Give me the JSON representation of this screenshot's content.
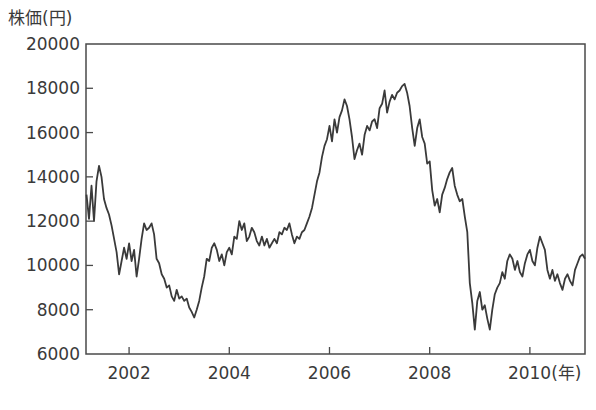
{
  "chart_data": {
    "type": "line",
    "title": "",
    "xlabel": "(年)",
    "ylabel": "株価(円)",
    "xlim": [
      2001.14,
      2011.1
    ],
    "ylim": [
      6000,
      20000
    ],
    "x_ticks": [
      2002,
      2004,
      2006,
      2008,
      2010
    ],
    "x_tick_labels": [
      "2002",
      "2004",
      "2006",
      "2008",
      "2010(年)"
    ],
    "y_ticks": [
      6000,
      8000,
      10000,
      12000,
      14000,
      16000,
      18000,
      20000
    ],
    "y_tick_labels": [
      "6000",
      "8000",
      "10000",
      "12000",
      "14000",
      "16000",
      "18000",
      "20000"
    ],
    "grid": false,
    "legend": null,
    "line_color": "#3a3a3a",
    "series": [
      {
        "name": "株価",
        "points": [
          [
            2001.15,
            13200
          ],
          [
            2001.2,
            12100
          ],
          [
            2001.25,
            13600
          ],
          [
            2001.3,
            12000
          ],
          [
            2001.35,
            13800
          ],
          [
            2001.4,
            14500
          ],
          [
            2001.45,
            14000
          ],
          [
            2001.5,
            13000
          ],
          [
            2001.55,
            12600
          ],
          [
            2001.6,
            12300
          ],
          [
            2001.65,
            11800
          ],
          [
            2001.7,
            11200
          ],
          [
            2001.75,
            10600
          ],
          [
            2001.8,
            9600
          ],
          [
            2001.85,
            10200
          ],
          [
            2001.9,
            10800
          ],
          [
            2001.95,
            10300
          ],
          [
            2002.0,
            11000
          ],
          [
            2002.05,
            10200
          ],
          [
            2002.1,
            10700
          ],
          [
            2002.15,
            9500
          ],
          [
            2002.2,
            10300
          ],
          [
            2002.25,
            11200
          ],
          [
            2002.3,
            11900
          ],
          [
            2002.35,
            11600
          ],
          [
            2002.4,
            11700
          ],
          [
            2002.45,
            11900
          ],
          [
            2002.5,
            11400
          ],
          [
            2002.55,
            10300
          ],
          [
            2002.6,
            10100
          ],
          [
            2002.65,
            9600
          ],
          [
            2002.7,
            9400
          ],
          [
            2002.75,
            9000
          ],
          [
            2002.8,
            9100
          ],
          [
            2002.85,
            8600
          ],
          [
            2002.9,
            8400
          ],
          [
            2002.95,
            8900
          ],
          [
            2003.0,
            8500
          ],
          [
            2003.05,
            8600
          ],
          [
            2003.1,
            8400
          ],
          [
            2003.15,
            8500
          ],
          [
            2003.2,
            8100
          ],
          [
            2003.25,
            7900
          ],
          [
            2003.3,
            7650
          ],
          [
            2003.35,
            8000
          ],
          [
            2003.4,
            8400
          ],
          [
            2003.45,
            9000
          ],
          [
            2003.5,
            9500
          ],
          [
            2003.55,
            10300
          ],
          [
            2003.6,
            10200
          ],
          [
            2003.65,
            10800
          ],
          [
            2003.7,
            11000
          ],
          [
            2003.75,
            10700
          ],
          [
            2003.8,
            10200
          ],
          [
            2003.85,
            10500
          ],
          [
            2003.9,
            10000
          ],
          [
            2003.95,
            10600
          ],
          [
            2004.0,
            10800
          ],
          [
            2004.05,
            10500
          ],
          [
            2004.1,
            11300
          ],
          [
            2004.15,
            11200
          ],
          [
            2004.2,
            12000
          ],
          [
            2004.25,
            11600
          ],
          [
            2004.3,
            11900
          ],
          [
            2004.35,
            11100
          ],
          [
            2004.4,
            11300
          ],
          [
            2004.45,
            11700
          ],
          [
            2004.5,
            11500
          ],
          [
            2004.55,
            11100
          ],
          [
            2004.6,
            10900
          ],
          [
            2004.65,
            11300
          ],
          [
            2004.7,
            10900
          ],
          [
            2004.75,
            11200
          ],
          [
            2004.8,
            10800
          ],
          [
            2004.85,
            11000
          ],
          [
            2004.9,
            11200
          ],
          [
            2004.95,
            11000
          ],
          [
            2005.0,
            11500
          ],
          [
            2005.05,
            11400
          ],
          [
            2005.1,
            11700
          ],
          [
            2005.15,
            11600
          ],
          [
            2005.2,
            11900
          ],
          [
            2005.25,
            11400
          ],
          [
            2005.3,
            11000
          ],
          [
            2005.35,
            11300
          ],
          [
            2005.4,
            11200
          ],
          [
            2005.45,
            11500
          ],
          [
            2005.5,
            11600
          ],
          [
            2005.55,
            11900
          ],
          [
            2005.6,
            12200
          ],
          [
            2005.65,
            12600
          ],
          [
            2005.7,
            13200
          ],
          [
            2005.75,
            13800
          ],
          [
            2005.8,
            14200
          ],
          [
            2005.85,
            14900
          ],
          [
            2005.9,
            15400
          ],
          [
            2005.95,
            15700
          ],
          [
            2006.0,
            16300
          ],
          [
            2006.05,
            15600
          ],
          [
            2006.1,
            16600
          ],
          [
            2006.15,
            16000
          ],
          [
            2006.2,
            16700
          ],
          [
            2006.25,
            17000
          ],
          [
            2006.3,
            17500
          ],
          [
            2006.35,
            17200
          ],
          [
            2006.4,
            16600
          ],
          [
            2006.45,
            15800
          ],
          [
            2006.5,
            14800
          ],
          [
            2006.55,
            15200
          ],
          [
            2006.6,
            15500
          ],
          [
            2006.65,
            15000
          ],
          [
            2006.7,
            15900
          ],
          [
            2006.75,
            16300
          ],
          [
            2006.8,
            16100
          ],
          [
            2006.85,
            16500
          ],
          [
            2006.9,
            16600
          ],
          [
            2006.95,
            16200
          ],
          [
            2007.0,
            17100
          ],
          [
            2007.05,
            17300
          ],
          [
            2007.1,
            17900
          ],
          [
            2007.15,
            16900
          ],
          [
            2007.2,
            17400
          ],
          [
            2007.25,
            17700
          ],
          [
            2007.3,
            17500
          ],
          [
            2007.35,
            17800
          ],
          [
            2007.4,
            17900
          ],
          [
            2007.45,
            18100
          ],
          [
            2007.5,
            18200
          ],
          [
            2007.55,
            17800
          ],
          [
            2007.6,
            17200
          ],
          [
            2007.65,
            16200
          ],
          [
            2007.7,
            15400
          ],
          [
            2007.75,
            16200
          ],
          [
            2007.8,
            16600
          ],
          [
            2007.85,
            15800
          ],
          [
            2007.9,
            15500
          ],
          [
            2007.95,
            14600
          ],
          [
            2008.0,
            14700
          ],
          [
            2008.05,
            13400
          ],
          [
            2008.1,
            12700
          ],
          [
            2008.15,
            13000
          ],
          [
            2008.2,
            12400
          ],
          [
            2008.25,
            13200
          ],
          [
            2008.3,
            13500
          ],
          [
            2008.35,
            13900
          ],
          [
            2008.4,
            14200
          ],
          [
            2008.45,
            14400
          ],
          [
            2008.5,
            13600
          ],
          [
            2008.55,
            13200
          ],
          [
            2008.6,
            12900
          ],
          [
            2008.65,
            13000
          ],
          [
            2008.7,
            12200
          ],
          [
            2008.75,
            11500
          ],
          [
            2008.8,
            9200
          ],
          [
            2008.85,
            8300
          ],
          [
            2008.9,
            7100
          ],
          [
            2008.95,
            8400
          ],
          [
            2009.0,
            8800
          ],
          [
            2009.05,
            8000
          ],
          [
            2009.1,
            8200
          ],
          [
            2009.15,
            7600
          ],
          [
            2009.2,
            7100
          ],
          [
            2009.25,
            8000
          ],
          [
            2009.3,
            8700
          ],
          [
            2009.35,
            9000
          ],
          [
            2009.4,
            9200
          ],
          [
            2009.45,
            9700
          ],
          [
            2009.5,
            9400
          ],
          [
            2009.55,
            10200
          ],
          [
            2009.6,
            10500
          ],
          [
            2009.65,
            10300
          ],
          [
            2009.7,
            9800
          ],
          [
            2009.75,
            10200
          ],
          [
            2009.8,
            9700
          ],
          [
            2009.85,
            9500
          ],
          [
            2009.9,
            10100
          ],
          [
            2009.95,
            10500
          ],
          [
            2010.0,
            10700
          ],
          [
            2010.05,
            10200
          ],
          [
            2010.1,
            10000
          ],
          [
            2010.15,
            10800
          ],
          [
            2010.2,
            11300
          ],
          [
            2010.25,
            11000
          ],
          [
            2010.3,
            10700
          ],
          [
            2010.35,
            9800
          ],
          [
            2010.4,
            9400
          ],
          [
            2010.45,
            9800
          ],
          [
            2010.5,
            9300
          ],
          [
            2010.55,
            9600
          ],
          [
            2010.6,
            9200
          ],
          [
            2010.65,
            8900
          ],
          [
            2010.7,
            9400
          ],
          [
            2010.75,
            9600
          ],
          [
            2010.8,
            9300
          ],
          [
            2010.85,
            9100
          ],
          [
            2010.9,
            9800
          ],
          [
            2010.95,
            10100
          ],
          [
            2011.0,
            10400
          ],
          [
            2011.05,
            10500
          ],
          [
            2011.1,
            10300
          ]
        ]
      }
    ]
  }
}
